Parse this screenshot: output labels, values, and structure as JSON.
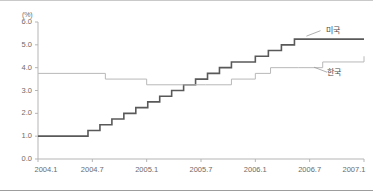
{
  "chart_data": {
    "type": "line",
    "title": "",
    "subtitle": "",
    "xlabel": "",
    "ylabel": "",
    "y_unit_label": "(%)",
    "ylim": [
      0.0,
      6.0
    ],
    "ytick_labels": [
      "0.0",
      "1.0",
      "2.0",
      "3.0",
      "4.0",
      "5.0",
      "6.0"
    ],
    "ytick_values": [
      0.0,
      1.0,
      2.0,
      3.0,
      4.0,
      5.0,
      6.0
    ],
    "xtick_labels": [
      "2004.1",
      "2004.7",
      "2005.1",
      "2005.7",
      "2006.1",
      "2006.7",
      "2007.1"
    ],
    "xtick_values": [
      2004.0,
      2004.5,
      2005.0,
      2005.5,
      2006.0,
      2006.5,
      2007.0
    ],
    "xlim": [
      2004.0,
      2007.0
    ],
    "grid": false,
    "legend_position": "inline-annotation",
    "step_style": "post",
    "series": [
      {
        "name": "미국",
        "label": "미국",
        "color": "#595959",
        "width": 1.6,
        "x": [
          2004.0,
          2004.46,
          2004.57,
          2004.68,
          2004.79,
          2004.9,
          2005.01,
          2005.12,
          2005.23,
          2005.34,
          2005.45,
          2005.56,
          2005.67,
          2005.78,
          2005.89,
          2006.0,
          2006.12,
          2006.24,
          2006.36,
          2006.48,
          2007.0
        ],
        "values": [
          1.0,
          1.25,
          1.5,
          1.75,
          2.0,
          2.25,
          2.5,
          2.75,
          3.0,
          3.25,
          3.5,
          3.75,
          4.0,
          4.25,
          4.25,
          4.5,
          4.75,
          5.0,
          5.25,
          5.25,
          5.25
        ]
      },
      {
        "name": "한국",
        "label": "한국",
        "color": "#b8b8b8",
        "width": 1.0,
        "x": [
          2004.0,
          2004.62,
          2005.0,
          2005.54,
          2005.78,
          2006.0,
          2006.14,
          2006.4,
          2006.62,
          2007.0
        ],
        "values": [
          3.75,
          3.5,
          3.25,
          3.25,
          3.5,
          3.75,
          4.0,
          4.0,
          4.25,
          4.5
        ]
      }
    ],
    "annotations": [
      {
        "text": "미국",
        "x": 2006.62,
        "y": 5.7
      },
      {
        "text": "한국",
        "x": 2006.63,
        "y": 3.85
      }
    ]
  }
}
